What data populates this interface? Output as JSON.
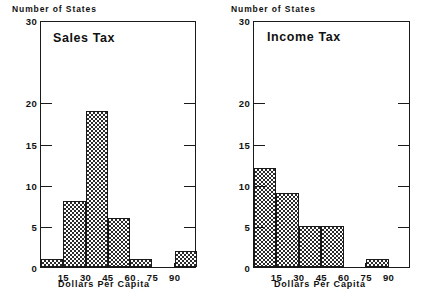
{
  "figure": {
    "panels": [
      {
        "id": "sales",
        "title": "Sales Tax",
        "ylabel": "Number of States",
        "xlabel": "Dollars Per Capita"
      },
      {
        "id": "income",
        "title": "Income Tax",
        "ylabel": "Number of States",
        "xlabel": "Dollars Per Capita"
      }
    ]
  },
  "axes": {
    "y_ticks": [
      0,
      5,
      10,
      15,
      20,
      30
    ],
    "y_tick_labels": [
      "0",
      "5",
      "10",
      "15",
      "20",
      "30"
    ],
    "x_ticks": [
      15,
      30,
      45,
      60,
      75,
      90
    ],
    "x_tick_labels": [
      "15",
      "30",
      "45",
      "60",
      "75",
      "90"
    ]
  },
  "chart_data": [
    {
      "type": "bar",
      "title": "Sales Tax",
      "xlabel": "Dollars Per Capita",
      "ylabel": "Number of States",
      "bin_edges": [
        0,
        15,
        30,
        45,
        60,
        75,
        90,
        105
      ],
      "categories": [
        "0-15",
        "15-30",
        "30-45",
        "45-60",
        "60-75",
        "75-90",
        "90-105"
      ],
      "values": [
        1,
        8,
        19,
        6,
        1,
        0,
        2
      ],
      "xlim": [
        0,
        105
      ],
      "ylim": [
        0,
        30
      ],
      "grid": false,
      "legend": "none"
    },
    {
      "type": "bar",
      "title": "Income Tax",
      "xlabel": "Dollars Per Capita",
      "ylabel": "Number of States",
      "bin_edges": [
        0,
        15,
        30,
        45,
        60,
        75,
        90,
        105
      ],
      "categories": [
        "0-15",
        "15-30",
        "30-45",
        "45-60",
        "60-75",
        "75-90",
        "90-105"
      ],
      "values": [
        12,
        9,
        5,
        5,
        0,
        1,
        0
      ],
      "xlim": [
        0,
        105
      ],
      "ylim": [
        0,
        30
      ],
      "grid": false,
      "legend": "none"
    }
  ],
  "style": {
    "bar_fill": "checkerboard",
    "ink": "#1a1a1a",
    "background": "#ffffff"
  }
}
